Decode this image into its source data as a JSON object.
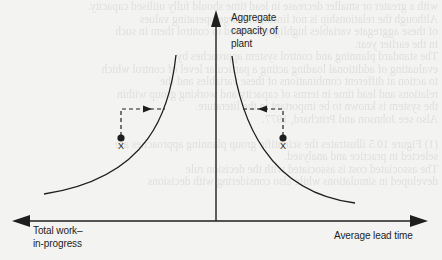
{
  "figure": {
    "y_axis_label_lines": [
      "Aggregate",
      "capacity of",
      "plant"
    ],
    "x_axis_left_label_lines": [
      "Total work–",
      "in-progress"
    ],
    "x_axis_right_label": "Average lead time",
    "point_left_label": "X",
    "point_right_label": "X",
    "colors": {
      "ink": "#1e1e1e",
      "background": "#f3f3f1",
      "bleed_text": "#cfcfcc"
    }
  },
  "diagram": {
    "axes": {
      "origin": [
        216,
        221
      ],
      "vertical_arrow_tip": [
        216,
        10
      ],
      "horizontal_left_tip": [
        12,
        221
      ],
      "horizontal_right_tip": [
        428,
        221
      ]
    },
    "curves": [
      {
        "name": "wip-capacity-curve",
        "from": [
          176,
          55
        ],
        "to": [
          44,
          194
        ]
      },
      {
        "name": "leadtime-capacity-curve",
        "from": [
          232,
          56
        ],
        "to": [
          355,
          203
        ]
      }
    ],
    "points": [
      {
        "name": "point-x-left",
        "at": [
          121,
          138
        ],
        "dashed_up_to_y": 109,
        "arrow_to_x": 166,
        "direction": "right"
      },
      {
        "name": "point-x-right",
        "at": [
          283,
          138
        ],
        "dashed_up_to_y": 109,
        "arrow_to_x": 242,
        "direction": "left"
      }
    ]
  },
  "bleed_text": [
    "with a greater or smaller decrease in lead time should fully utilised capacity.",
    "Although the relationship is not linear, the large operating values",
    "of these aggregate variables highlight the need to control them in such",
    "in the earlier year.",
    "The standard planning and control system approaches by",
    "evaluating of additional loading acting a particular level of control which",
    "to action at different combinations of these variables and the",
    "relations and lead time in terms of capacity and working group within",
    "the system is known to be important in the literature.",
    "Also see Johnson and Pritchard, 1977.",
    "",
    "(1) Figure 10.5 illustrates the scientific group planning approaches are",
    "selected in practice and analysed.",
    "The associated cost is associated with the decision rule",
    "developed in simulations while also considering with decisions"
  ]
}
